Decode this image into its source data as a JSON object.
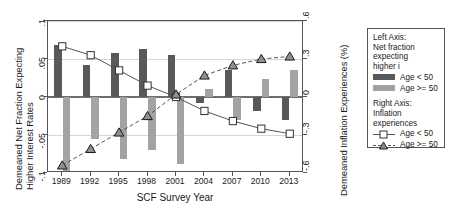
{
  "chart_data": {
    "type": "bar",
    "title": "",
    "xlabel": "SCF Survey Year",
    "ylabel_left": "Demeaned Net Fraction Expecting Higher Interest Rates",
    "ylabel_left_line1": "Demeaned Net Fraction Expecting",
    "ylabel_left_line2": "Higher Interest Rates",
    "ylabel_right": "Demeaned Inflation Experiences (%)",
    "categories": [
      "1989",
      "1992",
      "1995",
      "1998",
      "2001",
      "2004",
      "2007",
      "2010",
      "2013"
    ],
    "x": [
      1989,
      1992,
      1995,
      1998,
      2001,
      2004,
      2007,
      2010,
      2013
    ],
    "ylim_left": [
      -0.1,
      0.1
    ],
    "ylim_right": [
      -0.6,
      0.6
    ],
    "yticks_left": [
      ".1",
      ".05",
      "0",
      "-.05",
      "-.1"
    ],
    "yticks_left_values": [
      0.1,
      0.05,
      0,
      -0.05,
      -0.1
    ],
    "yticks_right": [
      ".6",
      ".3",
      "0",
      "-.3",
      "-.6"
    ],
    "yticks_right_values": [
      0.6,
      0.3,
      0,
      -0.3,
      -0.6
    ],
    "grid": true,
    "legend_position": "right-outside",
    "series": [
      {
        "name": "Age < 50",
        "group": "Net fraction expecting higher i",
        "axis": "left",
        "type": "bar",
        "color": "#595959",
        "values": [
          0.068,
          0.042,
          0.058,
          0.063,
          0.055,
          -0.008,
          0.036,
          -0.018,
          -0.03
        ]
      },
      {
        "name": "Age >= 50",
        "group": "Net fraction expecting higher i",
        "axis": "left",
        "type": "bar",
        "color": "#a3a3a3",
        "values": [
          -0.1,
          -0.055,
          -0.082,
          -0.07,
          -0.088,
          0.01,
          -0.03,
          0.024,
          0.035
        ]
      },
      {
        "name": "Age < 50",
        "group": "Inflation experiences",
        "axis": "right",
        "type": "line",
        "marker": "square",
        "color": "#555555",
        "dash": "solid",
        "values": [
          0.4,
          0.33,
          0.21,
          0.09,
          0.0,
          -0.11,
          -0.19,
          -0.25,
          -0.29
        ]
      },
      {
        "name": "Age >= 50",
        "group": "Inflation experiences",
        "axis": "right",
        "type": "line",
        "marker": "triangle",
        "color": "#555555",
        "dash": "dashed",
        "values": [
          -0.54,
          -0.41,
          -0.28,
          -0.15,
          0.02,
          0.17,
          0.25,
          0.3,
          0.32
        ]
      }
    ]
  },
  "legend": {
    "left_header_line1": "Left Axis:",
    "left_header_line2": "Net fraction",
    "left_header_line3": "expecting",
    "left_header_line4": "higher i",
    "left_item_1": "Age < 50",
    "left_item_2": "Age >= 50",
    "right_header_line1": "Right Axis:",
    "right_header_line2": "Inflation",
    "right_header_line3": "experiences",
    "right_item_1": "Age < 50",
    "right_item_2": "Age >= 50"
  }
}
